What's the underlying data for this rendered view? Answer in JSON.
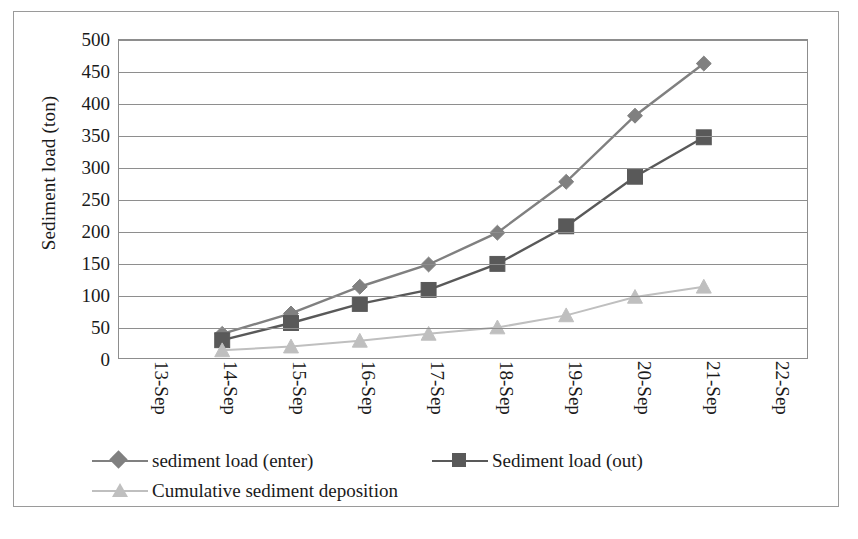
{
  "chart_data": {
    "type": "line",
    "title": "",
    "xlabel": "",
    "ylabel": "Sediment load (ton)",
    "categories": [
      "13-Sep",
      "14-Sep",
      "15-Sep",
      "16-Sep",
      "17-Sep",
      "18-Sep",
      "19-Sep",
      "20-Sep",
      "21-Sep",
      "22-Sep"
    ],
    "ylim": [
      0,
      500
    ],
    "yticks": [
      0,
      50,
      100,
      150,
      200,
      250,
      300,
      350,
      400,
      450,
      500
    ],
    "grid": "horizontal",
    "legend_position": "bottom",
    "series": [
      {
        "name": "sediment load (enter)",
        "marker": "diamond",
        "color": "#808080",
        "x": [
          "14-Sep",
          "15-Sep",
          "16-Sep",
          "17-Sep",
          "18-Sep",
          "19-Sep",
          "20-Sep",
          "21-Sep"
        ],
        "values": [
          38,
          70,
          112,
          147,
          197,
          277,
          381,
          463
        ]
      },
      {
        "name": "Sediment load (out)",
        "marker": "square",
        "color": "#595959",
        "x": [
          "14-Sep",
          "15-Sep",
          "16-Sep",
          "17-Sep",
          "18-Sep",
          "19-Sep",
          "20-Sep",
          "21-Sep"
        ],
        "values": [
          28,
          55,
          85,
          107,
          148,
          207,
          285,
          347
        ]
      },
      {
        "name": "Cumulative sediment deposition",
        "marker": "triangle",
        "color": "#bfbfbf",
        "x": [
          "14-Sep",
          "15-Sep",
          "16-Sep",
          "17-Sep",
          "18-Sep",
          "19-Sep",
          "20-Sep",
          "21-Sep"
        ],
        "values": [
          12,
          18,
          27,
          38,
          48,
          67,
          96,
          112
        ]
      }
    ]
  },
  "axes": {
    "y_title": "Sediment load (ton)",
    "y_tick_labels": [
      "500",
      "450",
      "400",
      "350",
      "300",
      "250",
      "200",
      "150",
      "100",
      "50",
      "0"
    ],
    "x_tick_labels": [
      "13-Sep",
      "14-Sep",
      "15-Sep",
      "16-Sep",
      "17-Sep",
      "18-Sep",
      "19-Sep",
      "20-Sep",
      "21-Sep",
      "22-Sep"
    ]
  },
  "legend": {
    "items": [
      {
        "label": "sediment load (enter)",
        "marker": "diamond-marker-icon",
        "color": "#808080"
      },
      {
        "label": "Sediment load (out)",
        "marker": "square-marker-icon",
        "color": "#595959"
      },
      {
        "label": "Cumulative sediment deposition",
        "marker": "triangle-marker-icon",
        "color": "#bfbfbf"
      }
    ]
  },
  "caption": {
    "partial_text": ""
  }
}
